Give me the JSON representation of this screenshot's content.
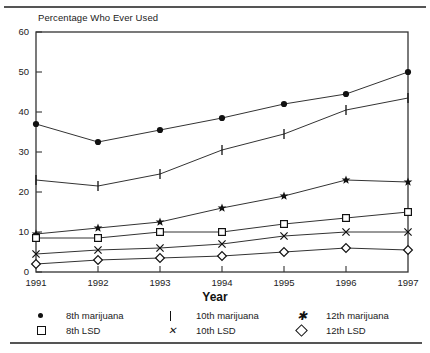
{
  "figure": {
    "yaxis_title": "Percentage Who Ever Used",
    "xaxis_title": "Year"
  },
  "legend": {
    "items": [
      {
        "label": "8th marijuana",
        "marker": "filled-circle-marker"
      },
      {
        "label": "8th LSD",
        "marker": "open-square-marker"
      },
      {
        "label": "10th marijuana",
        "marker": "vertical-bar-marker"
      },
      {
        "label": "10th LSD",
        "marker": "x-cross-marker"
      },
      {
        "label": "12th marijuana",
        "marker": "filled-star-marker"
      },
      {
        "label": "12th LSD",
        "marker": "open-diamond-marker"
      }
    ]
  },
  "chart_data": {
    "type": "line",
    "title": "",
    "xlabel": "Year",
    "ylabel": "Percentage Who Ever Used",
    "categories": [
      "1991",
      "1992",
      "1993",
      "1994",
      "1995",
      "1996",
      "1997"
    ],
    "x": [
      1991,
      1992,
      1993,
      1994,
      1995,
      1996,
      1997
    ],
    "ylim": [
      0,
      60
    ],
    "yticks": [
      0,
      10,
      20,
      30,
      40,
      50,
      60
    ],
    "xticks": [
      "1991",
      "1992",
      "1993",
      "1994",
      "1995",
      "1996",
      "1997"
    ],
    "grid": false,
    "legend_position": "below",
    "series": [
      {
        "name": "8th marijuana",
        "marker": "filled-circle",
        "values": [
          37,
          32.5,
          35.5,
          38.5,
          42,
          44.5,
          50
        ]
      },
      {
        "name": "10th marijuana",
        "marker": "vertical-bar",
        "values": [
          23,
          21.5,
          24.5,
          30.5,
          34.5,
          40.5,
          43.5
        ]
      },
      {
        "name": "12th marijuana",
        "marker": "filled-star",
        "values": [
          9.5,
          11,
          12.5,
          16,
          19,
          23,
          22.5
        ]
      },
      {
        "name": "8th LSD",
        "marker": "open-square",
        "values": [
          8.5,
          8.5,
          10,
          10,
          12,
          13.5,
          15
        ]
      },
      {
        "name": "10th LSD",
        "marker": "x-cross",
        "values": [
          4.5,
          5.5,
          6,
          7,
          9,
          10,
          10
        ]
      },
      {
        "name": "12th LSD",
        "marker": "open-diamond",
        "values": [
          2,
          3,
          3.5,
          4,
          5,
          6,
          5.5
        ]
      }
    ],
    "colors": {
      "line": "#333333",
      "marker": "#111111",
      "axis": "#333333"
    }
  }
}
